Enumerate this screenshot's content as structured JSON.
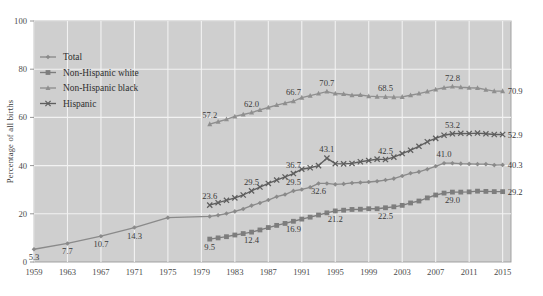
{
  "chart_data": {
    "type": "line",
    "title": "",
    "subtitle": "",
    "xlabel": "",
    "ylabel": "Percentage of all births",
    "xlim": [
      1959,
      2016
    ],
    "ylim": [
      0,
      100
    ],
    "grid": true,
    "legend_position": "top-left",
    "ytick_labels": [
      "0",
      "20",
      "40",
      "60",
      "80",
      "100"
    ],
    "ytick_values": [
      0,
      20,
      40,
      60,
      80,
      100
    ],
    "xtick_labels": [
      "1959",
      "1963",
      "1967",
      "1971",
      "1975",
      "1979",
      "1983",
      "1987",
      "1991",
      "1995",
      "1999",
      "2003",
      "2007",
      "2011",
      "2015"
    ],
    "xtick_values": [
      1959,
      1963,
      1967,
      1971,
      1975,
      1979,
      1983,
      1987,
      1991,
      1995,
      1999,
      2003,
      2007,
      2011,
      2015
    ],
    "series": [
      {
        "name": "Total",
        "marker": "diamond",
        "color": "#8a8a8a",
        "x": [
          1959,
          1963,
          1967,
          1971,
          1975,
          1980,
          1981,
          1982,
          1983,
          1984,
          1985,
          1986,
          1987,
          1988,
          1989,
          1990,
          1991,
          1992,
          1993,
          1994,
          1995,
          1996,
          1997,
          1998,
          1999,
          2000,
          2001,
          2002,
          2003,
          2004,
          2005,
          2006,
          2007,
          2008,
          2009,
          2010,
          2011,
          2012,
          2013,
          2014,
          2015
        ],
        "values": [
          5.3,
          7.7,
          10.7,
          14.3,
          18.4,
          18.9,
          19.4,
          20.1,
          21.0,
          22.0,
          23.4,
          24.5,
          25.7,
          27.1,
          28.0,
          29.5,
          30.1,
          31.0,
          32.6,
          32.6,
          32.2,
          32.4,
          32.8,
          33.0,
          33.2,
          33.5,
          34.0,
          34.6,
          35.7,
          36.8,
          37.4,
          38.5,
          39.7,
          41.0,
          41.0,
          40.8,
          40.7,
          40.6,
          40.6,
          40.2,
          40.3
        ],
        "labeled_points": [
          {
            "x": 1959,
            "value": 5.3
          },
          {
            "x": 1963,
            "value": 7.7
          },
          {
            "x": 1967,
            "value": 10.7
          },
          {
            "x": 1971,
            "value": 14.3
          },
          {
            "x": 1990,
            "value": 29.5
          },
          {
            "x": 1993,
            "value": 32.6
          },
          {
            "x": 2008,
            "value": 41.0
          },
          {
            "x": 2015,
            "value": 40.3
          }
        ]
      },
      {
        "name": "Non-Hispanic white",
        "marker": "square",
        "color": "#7d7d7d",
        "x": [
          1980,
          1981,
          1982,
          1983,
          1984,
          1985,
          1986,
          1987,
          1988,
          1989,
          1990,
          1991,
          1992,
          1993,
          1994,
          1995,
          1996,
          1997,
          1998,
          1999,
          2000,
          2001,
          2002,
          2003,
          2004,
          2005,
          2006,
          2007,
          2008,
          2009,
          2010,
          2011,
          2012,
          2013,
          2014,
          2015
        ],
        "values": [
          9.5,
          10.0,
          10.5,
          11.2,
          11.8,
          12.4,
          13.3,
          14.3,
          15.2,
          16.0,
          16.9,
          17.8,
          18.6,
          19.5,
          20.4,
          21.2,
          21.5,
          21.8,
          21.9,
          22.1,
          22.1,
          22.5,
          22.9,
          23.5,
          24.5,
          25.3,
          26.6,
          27.8,
          28.6,
          29.0,
          29.0,
          29.1,
          29.4,
          29.3,
          29.2,
          29.2
        ],
        "labeled_points": [
          {
            "x": 1980,
            "value": 9.5
          },
          {
            "x": 1985,
            "value": 12.4
          },
          {
            "x": 1990,
            "value": 16.9
          },
          {
            "x": 1995,
            "value": 21.2
          },
          {
            "x": 2001,
            "value": 22.5
          },
          {
            "x": 2009,
            "value": 29.0
          },
          {
            "x": 2015,
            "value": 29.2
          }
        ]
      },
      {
        "name": "Non-Hispanic black",
        "marker": "triangle",
        "color": "#8f8f8f",
        "x": [
          1980,
          1981,
          1982,
          1983,
          1984,
          1985,
          1986,
          1987,
          1988,
          1989,
          1990,
          1991,
          1992,
          1993,
          1994,
          1995,
          1996,
          1997,
          1998,
          1999,
          2000,
          2001,
          2002,
          2003,
          2004,
          2005,
          2006,
          2007,
          2008,
          2009,
          2010,
          2011,
          2012,
          2013,
          2014,
          2015
        ],
        "values": [
          57.2,
          58.2,
          59.2,
          60.4,
          61.2,
          62.0,
          63.1,
          64.1,
          65.1,
          65.9,
          66.7,
          68.2,
          69.0,
          69.9,
          70.7,
          69.9,
          69.7,
          69.2,
          69.3,
          68.8,
          68.6,
          68.5,
          68.4,
          68.5,
          69.2,
          69.9,
          70.7,
          71.6,
          72.3,
          72.8,
          72.5,
          72.3,
          72.2,
          71.5,
          70.9,
          70.9
        ],
        "labeled_points": [
          {
            "x": 1980,
            "value": 57.2
          },
          {
            "x": 1985,
            "value": 62.0
          },
          {
            "x": 1990,
            "value": 66.7
          },
          {
            "x": 1994,
            "value": 70.7
          },
          {
            "x": 2001,
            "value": 68.5
          },
          {
            "x": 2009,
            "value": 72.8
          },
          {
            "x": 2015,
            "value": 70.9
          }
        ]
      },
      {
        "name": "Hispanic",
        "marker": "x",
        "color": "#5e5e5e",
        "x": [
          1980,
          1981,
          1982,
          1983,
          1984,
          1985,
          1986,
          1987,
          1988,
          1989,
          1990,
          1991,
          1992,
          1993,
          1994,
          1995,
          1996,
          1997,
          1998,
          1999,
          2000,
          2001,
          2002,
          2003,
          2004,
          2005,
          2006,
          2007,
          2008,
          2009,
          2010,
          2011,
          2012,
          2013,
          2014,
          2015
        ],
        "values": [
          23.6,
          24.6,
          25.6,
          26.6,
          27.8,
          29.5,
          31.1,
          32.6,
          34.0,
          35.3,
          36.7,
          38.5,
          39.1,
          40.0,
          43.1,
          40.8,
          40.7,
          40.9,
          41.6,
          42.1,
          42.7,
          42.5,
          43.5,
          45.0,
          46.4,
          48.0,
          49.9,
          51.3,
          52.6,
          53.2,
          53.4,
          53.3,
          53.5,
          53.2,
          52.9,
          52.9
        ],
        "labeled_points": [
          {
            "x": 1980,
            "value": 23.6
          },
          {
            "x": 1985,
            "value": 29.5
          },
          {
            "x": 1990,
            "value": 36.7
          },
          {
            "x": 1994,
            "value": 43.1
          },
          {
            "x": 2001,
            "value": 42.5
          },
          {
            "x": 2009,
            "value": 53.2
          },
          {
            "x": 2015,
            "value": 52.9
          }
        ]
      }
    ]
  },
  "legend": {
    "items": [
      {
        "label": "Total",
        "marker": "diamond"
      },
      {
        "label": "Non-Hispanic white",
        "marker": "square"
      },
      {
        "label": "Non-Hispanic black",
        "marker": "triangle"
      },
      {
        "label": "Hispanic",
        "marker": "x"
      }
    ]
  },
  "colors": {
    "plot_background": "#cfcfcf",
    "page_background": "#ffffff",
    "gridline": "#f2f2f2",
    "axis_text": "#4a4a4a",
    "plot_border": "#9a9a9a"
  }
}
